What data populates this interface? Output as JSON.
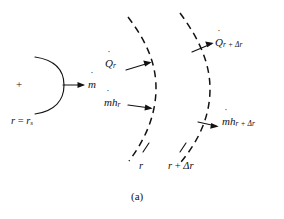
{
  "figure": {
    "caption": "(a)",
    "kind": "schematic-diagram",
    "background_color": "#ffffff",
    "stroke_color": "#121212"
  },
  "inner_surface": {
    "marker": "+",
    "radius_label_prefix": "r",
    "radius_label_equals": " = ",
    "radius_label_value": "r",
    "radius_label_subscript": "s",
    "mass_flow_symbol": "m",
    "mass_flow_dot": "˙"
  },
  "shell": {
    "inner_arc_label": "r",
    "outer_arc_label_base": "r",
    "outer_arc_label_plus": " + ",
    "outer_arc_label_delta": "Δr"
  },
  "fluxes": [
    {
      "name": "heat-flux-in",
      "symbol": "Q",
      "dot": "˙",
      "subscript": "r",
      "direction": "inward-radial"
    },
    {
      "name": "enthalpy-flux-in",
      "symbol": "m",
      "dot": "˙",
      "symbol2": "h",
      "subscript": "r",
      "direction": "inward-radial"
    },
    {
      "name": "heat-flux-out",
      "symbol": "Q",
      "dot": "˙",
      "subscript": "r + Δr",
      "direction": "outward-radial"
    },
    {
      "name": "enthalpy-flux-out",
      "symbol": "m",
      "dot": "˙",
      "symbol2": "h",
      "subscript": "r + Δr",
      "direction": "outward-radial"
    }
  ]
}
